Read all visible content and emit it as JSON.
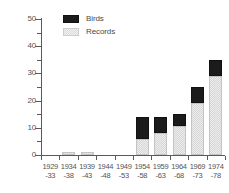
{
  "chart_data": {
    "type": "bar",
    "subtype": "stacked",
    "title": "",
    "xlabel": "",
    "ylabel": "",
    "ylim": [
      0,
      50
    ],
    "yticks": [
      0,
      10,
      20,
      30,
      40,
      50
    ],
    "ytick_labels": [
      "0",
      "10",
      "20",
      "30",
      "40",
      "50"
    ],
    "yminor_ticks": [
      5,
      15,
      25,
      35,
      45
    ],
    "grid": false,
    "legend_position": "upper-left-inside",
    "categories": [
      "1929-33",
      "1934-38",
      "1939-43",
      "1944-48",
      "1949-53",
      "1954-58",
      "1959-63",
      "1964-68",
      "1969-73",
      "1974-78"
    ],
    "category_lines": [
      {
        "line1": "1929",
        "line2": "-33"
      },
      {
        "line1": "1934",
        "line2": "-38"
      },
      {
        "line1": "1939",
        "line2": "-43"
      },
      {
        "line1": "1944",
        "line2": "-48"
      },
      {
        "line1": "1949",
        "line2": "-53"
      },
      {
        "line1": "1954",
        "line2": "-58"
      },
      {
        "line1": "1959",
        "line2": "-63"
      },
      {
        "line1": "1964",
        "line2": "-68"
      },
      {
        "line1": "1969",
        "line2": "-73"
      },
      {
        "line1": "1974",
        "line2": "-78"
      }
    ],
    "series": [
      {
        "name": "Records",
        "color": "#d6d6d6",
        "values": [
          0,
          1,
          1,
          0,
          0,
          6,
          8,
          10.5,
          19,
          29
        ]
      },
      {
        "name": "Birds",
        "color": "#1b1b1b",
        "values": [
          0,
          0,
          0,
          0,
          0,
          8,
          6,
          4.5,
          6,
          6
        ]
      }
    ],
    "totals": [
      0,
      1,
      1,
      0,
      0,
      14,
      14,
      15,
      25,
      35
    ]
  },
  "legend": {
    "items": [
      {
        "label": "Birds",
        "swatch": "birds"
      },
      {
        "label": "Records",
        "swatch": "records"
      }
    ]
  }
}
